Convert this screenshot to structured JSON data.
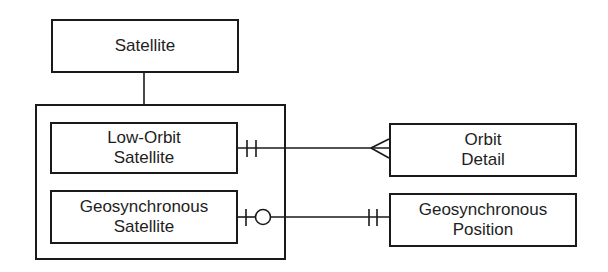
{
  "diagram": {
    "type": "entity-relationship",
    "supertype": {
      "name": "Satellite"
    },
    "subtypes": [
      {
        "line1": "Low-Orbit",
        "line2": "Satellite"
      },
      {
        "line1": "Geosynchronous",
        "line2": "Satellite"
      }
    ],
    "entities": [
      {
        "line1": "Orbit",
        "line2": "Detail"
      },
      {
        "line1": "Geosynchronous",
        "line2": "Position"
      }
    ],
    "relationships": [
      {
        "from": "Low-Orbit Satellite",
        "to": "Orbit Detail",
        "from_cardinality": "exactly-one",
        "to_cardinality": "many"
      },
      {
        "from": "Geosynchronous Satellite",
        "to": "Geosynchronous Position",
        "from_cardinality": "zero-or-one",
        "to_cardinality": "exactly-one"
      }
    ]
  }
}
